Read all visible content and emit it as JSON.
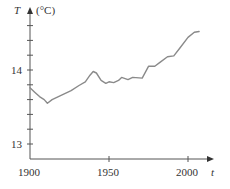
{
  "chart_data": {
    "type": "line",
    "title": "",
    "xlabel": "t",
    "ylabel": "T",
    "ylabel_unit": "(°C)",
    "x_ticks": [
      1900,
      1950,
      2000
    ],
    "x_tick_labels": [
      "1900",
      "1950",
      "2000"
    ],
    "y_ticks": [
      13,
      14
    ],
    "y_tick_labels": [
      "13",
      "14"
    ],
    "y_minor_step": 0.2,
    "xlim": [
      1900,
      2017
    ],
    "ylim": [
      12.8,
      14.9
    ],
    "grid": false,
    "series": [
      {
        "name": "Global average temperature",
        "color": "#8a8a8a",
        "x": [
          1900,
          1903,
          1906,
          1909,
          1911,
          1914,
          1920,
          1926,
          1931,
          1935,
          1938,
          1940,
          1942,
          1945,
          1948,
          1950,
          1953,
          1956,
          1958,
          1962,
          1965,
          1971,
          1975,
          1979,
          1982,
          1987,
          1991,
          1995,
          2000,
          2004,
          2007
        ],
        "values": [
          13.76,
          13.7,
          13.64,
          13.6,
          13.55,
          13.6,
          13.66,
          13.72,
          13.79,
          13.84,
          13.93,
          13.98,
          13.96,
          13.86,
          13.82,
          13.84,
          13.83,
          13.86,
          13.9,
          13.87,
          13.9,
          13.89,
          14.05,
          14.05,
          14.1,
          14.18,
          14.19,
          14.3,
          14.44,
          14.51,
          14.52
        ]
      }
    ]
  },
  "axes": {
    "y_axis_symbol": "T",
    "y_axis_unit": "(°C)",
    "x_axis_symbol": "t",
    "y_labels": {
      "high": "14",
      "low": "13"
    },
    "x_labels": {
      "a": "1900",
      "b": "1950",
      "c": "2000"
    }
  }
}
